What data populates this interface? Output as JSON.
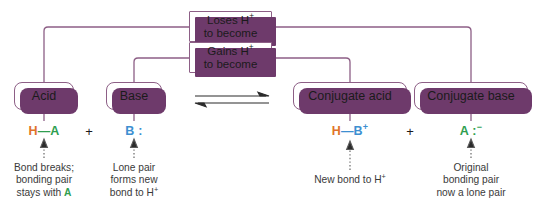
{
  "diagram": {
    "colors": {
      "box_border": "#8d5f86",
      "box_shadow": "#6e3a6b",
      "connector": "#8d5f86",
      "hydrogen": "#e0732a",
      "acid_A": "#2f9e4f",
      "base_B": "#3d8fd1",
      "text": "#1b1b1b",
      "caption_text": "#3a3a3a",
      "background": "#ffffff"
    },
    "banners": [
      {
        "id": "loses-h",
        "line1": "Loses H",
        "line1_sup": "+",
        "line2": "to become"
      },
      {
        "id": "gains-h",
        "line1": "Gains H",
        "line1_sup": "+",
        "line2": "to become"
      }
    ],
    "terms": [
      {
        "id": "acid",
        "label": "Acid"
      },
      {
        "id": "base",
        "label": "Base"
      },
      {
        "id": "conjugate-acid",
        "label": "Conjugate acid"
      },
      {
        "id": "conjugate-base",
        "label": "Conjugate base"
      }
    ],
    "equilibrium_symbol": "⇌",
    "operators": [
      {
        "id": "plus-left",
        "label": "+"
      },
      {
        "id": "plus-right",
        "label": "+"
      }
    ],
    "formulas": [
      {
        "id": "formula-acid",
        "parts": [
          {
            "text": "H",
            "color_role": "hydrogen"
          },
          {
            "text": "—",
            "color_role": "acid_A"
          },
          {
            "text": "A",
            "color_role": "acid_A"
          }
        ],
        "plain": "H—A"
      },
      {
        "id": "formula-base",
        "parts": [
          {
            "text": "B",
            "color_role": "base_B"
          },
          {
            "text": " :",
            "color_role": "base_B"
          }
        ],
        "plain": "B :"
      },
      {
        "id": "formula-conjugate-acid",
        "parts": [
          {
            "text": "H",
            "color_role": "hydrogen"
          },
          {
            "text": "—",
            "color_role": "base_B"
          },
          {
            "text": "B",
            "color_role": "base_B"
          },
          {
            "text": "+",
            "color_role": "base_B",
            "superscript": true
          }
        ],
        "plain": "H—B+"
      },
      {
        "id": "formula-conjugate-base",
        "parts": [
          {
            "text": "A",
            "color_role": "acid_A"
          },
          {
            "text": " :",
            "color_role": "acid_A"
          },
          {
            "text": "−",
            "color_role": "acid_A",
            "superscript": true
          }
        ],
        "plain": "A :−"
      }
    ],
    "captions": [
      {
        "id": "caption-acid",
        "lines": [
          "Bond breaks;",
          "bonding pair",
          "stays with A"
        ],
        "highlight": "A"
      },
      {
        "id": "caption-base",
        "lines": [
          "Lone pair",
          "forms new",
          "bond to H+"
        ]
      },
      {
        "id": "caption-conjugate-acid",
        "lines": [
          "New bond to H+"
        ]
      },
      {
        "id": "caption-conjugate-base",
        "lines": [
          "Original",
          "bonding pair",
          "now a lone pair"
        ]
      }
    ]
  }
}
